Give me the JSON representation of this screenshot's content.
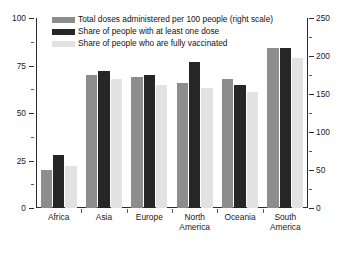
{
  "chart_data": {
    "type": "bar",
    "title": "",
    "subtitle": "",
    "xlabel": "",
    "ylabel": "",
    "grid": false,
    "legend_position": "top-left",
    "categories": [
      "Africa",
      "Asia",
      "Europe",
      "North America",
      "Oceania",
      "South America"
    ],
    "category_labels_multiline": [
      [
        "Africa"
      ],
      [
        "Asia"
      ],
      [
        "Europe"
      ],
      [
        "North",
        "America"
      ],
      [
        "Oceania"
      ],
      [
        "South",
        "America"
      ]
    ],
    "left_axis": {
      "min": 0,
      "max": 100,
      "ticks": [
        0,
        25,
        50,
        75,
        100
      ],
      "tick_labels": [
        "0",
        "25",
        "50",
        "75",
        "100"
      ],
      "minor_ticks": [
        12.5,
        37.5,
        62.5,
        87.5
      ]
    },
    "right_axis": {
      "min": 0,
      "max": 250,
      "ticks": [
        0,
        50,
        100,
        150,
        200,
        250
      ],
      "tick_labels": [
        "0",
        "50",
        "100",
        "150",
        "200",
        "250"
      ],
      "minor_ticks": [
        25,
        75,
        125,
        175,
        225
      ]
    },
    "series": [
      {
        "name": "Total doses administered per 100 people (right scale)",
        "color": "#8d8d8d",
        "axis": "right",
        "values": [
          50,
          175,
          172,
          165,
          170,
          210
        ]
      },
      {
        "name": "Share of people with at least one dose",
        "color": "#262626",
        "axis": "left",
        "values": [
          28,
          72,
          70,
          77,
          65,
          84
        ]
      },
      {
        "name": "Share of people who are fully vaccinated",
        "color": "#e2e2e2",
        "axis": "left",
        "values": [
          22,
          68,
          65,
          63,
          61,
          79
        ]
      }
    ]
  },
  "legend": {
    "items": [
      "Total doses administered per 100 people (right scale)",
      "Share of people with at least one dose",
      "Share of people who are fully vaccinated"
    ]
  }
}
